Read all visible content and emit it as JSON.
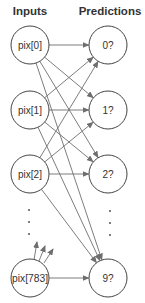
{
  "headers": {
    "inputs": "Inputs",
    "predictions": "Predictions"
  },
  "inputs": [
    {
      "label": "pix[0]",
      "cx": 30,
      "cy": 45
    },
    {
      "label": "pix[1]",
      "cx": 30,
      "cy": 110
    },
    {
      "label": "pix[2]",
      "cx": 30,
      "cy": 174
    },
    {
      "label": "pix[783]",
      "cx": 30,
      "cy": 278
    }
  ],
  "predictions": [
    {
      "label": "0?",
      "cx": 108,
      "cy": 45
    },
    {
      "label": "1?",
      "cx": 108,
      "cy": 110
    },
    {
      "label": "2?",
      "cx": 108,
      "cy": 174
    },
    {
      "label": "9?",
      "cx": 108,
      "cy": 278
    }
  ],
  "ellipsis": {
    "inputs_dots_y": [
      210,
      222,
      234
    ],
    "predictions_dots_y": [
      211,
      223,
      235
    ]
  },
  "colors": {
    "node_stroke": "#444444",
    "edge": "#6e6e6e",
    "text": "#333333",
    "background": "#ffffff"
  }
}
